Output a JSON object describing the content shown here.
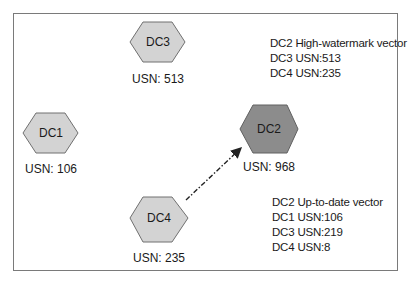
{
  "diagram": {
    "nodes": [
      {
        "id": "DC1",
        "label": "DC1",
        "usn": "USN: 106",
        "fill": "#d3d3d3"
      },
      {
        "id": "DC2",
        "label": "DC2",
        "usn": "USN: 968",
        "fill": "#8c8c8c"
      },
      {
        "id": "DC3",
        "label": "DC3",
        "usn": "USN: 513",
        "fill": "#d3d3d3"
      },
      {
        "id": "DC4",
        "label": "DC4",
        "usn": "USN: 235",
        "fill": "#d3d3d3"
      }
    ],
    "edges": [
      {
        "from": "DC4",
        "to": "DC2",
        "style": "dash-dot arrow"
      }
    ],
    "high_watermark": {
      "title": "DC2 High-watermark vector",
      "lines": [
        "DC3 USN:513",
        "DC4 USN:235"
      ]
    },
    "up_to_date": {
      "title": "DC2 Up-to-date vector",
      "lines": [
        "DC1 USN:106",
        "DC3 USN:219",
        "DC4 USN:8"
      ]
    }
  }
}
